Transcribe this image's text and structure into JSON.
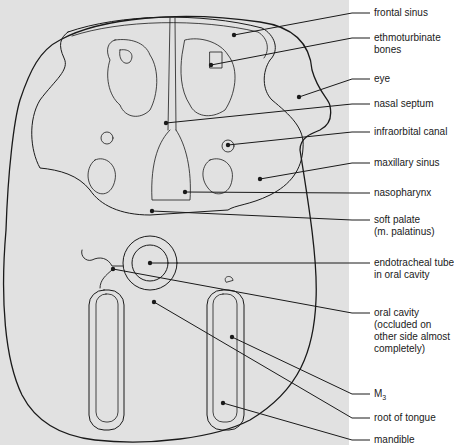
{
  "figure": {
    "background_color": "#e1e1e1",
    "line_color": "#1a1a1a"
  },
  "labels": [
    {
      "id": "frontal-sinus",
      "text": "frontal sinus",
      "y": 7,
      "point": [
        234,
        35
      ]
    },
    {
      "id": "ethmoturbinate-bones",
      "text": "ethmoturbinate\nbones",
      "y": 32,
      "point": [
        211,
        65
      ]
    },
    {
      "id": "eye",
      "text": "eye",
      "y": 73,
      "point": [
        299,
        97
      ]
    },
    {
      "id": "nasal-septum",
      "text": "nasal septum",
      "y": 98,
      "point": [
        166,
        123
      ]
    },
    {
      "id": "infraorbital-canal",
      "text": "infraorbital canal",
      "y": 126,
      "point": [
        228,
        145
      ]
    },
    {
      "id": "maxillary-sinus",
      "text": "maxillary sinus",
      "y": 157,
      "point": [
        260,
        179
      ]
    },
    {
      "id": "nasopharynx",
      "text": "nasopharynx",
      "y": 187,
      "point": [
        185,
        192
      ]
    },
    {
      "id": "soft-palate",
      "text": "soft palate\n(m. palatinus)",
      "y": 214,
      "point": [
        152,
        211
      ]
    },
    {
      "id": "endotracheal-tube",
      "text": "endotracheal tube\nin oral cavity",
      "y": 257,
      "point": [
        150,
        263
      ]
    },
    {
      "id": "oral-cavity",
      "text": "oral cavity\n(occluded on\nother side almost\ncompletely)",
      "y": 307,
      "point": [
        113,
        269
      ]
    },
    {
      "id": "m3",
      "text": "M",
      "sub": "3",
      "y": 388,
      "point": [
        232,
        337
      ]
    },
    {
      "id": "root-of-tongue",
      "text": "root of tongue",
      "y": 412,
      "point": [
        154,
        302
      ]
    },
    {
      "id": "mandible",
      "text": "mandible",
      "y": 434,
      "point": [
        223,
        403
      ]
    }
  ]
}
